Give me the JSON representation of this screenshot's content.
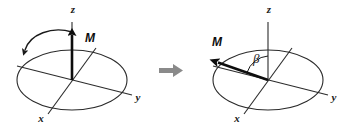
{
  "figure": {
    "width": 348,
    "height": 129,
    "background": "#ffffff",
    "stroke_color": "#2b2b2b",
    "vector_color": "#0d0d0d",
    "transition_arrow_color": "#8a8a8a"
  },
  "panels": [
    {
      "id": "equilibrium",
      "name": "left-panel",
      "origin": {
        "x": 72,
        "y": 80
      },
      "ellipse": {
        "cx": 72,
        "cy": 80,
        "rx": 55,
        "ry": 30
      },
      "axes": [
        {
          "name": "z",
          "label": "z",
          "label_x": 73,
          "label_y": 13,
          "x1": 72,
          "y1": 80,
          "x2": 72,
          "y2": 22,
          "arrowhead": false
        },
        {
          "name": "y",
          "label": "y",
          "label_x": 138,
          "label_y": 101,
          "x1": 17,
          "y1": 66,
          "x2": 132,
          "y2": 95,
          "arrowhead": false
        },
        {
          "name": "x",
          "label": "x",
          "label_x": 41,
          "label_y": 122,
          "x1": 96,
          "y1": 48,
          "x2": 48,
          "y2": 114,
          "arrowhead": false
        }
      ],
      "vector": {
        "name": "magnetization-vector",
        "label": "M",
        "label_x": 85,
        "label_y": 42,
        "x1": 72,
        "y1": 80,
        "x2": 72,
        "y2": 33,
        "direction": "along +z"
      },
      "precession_arrow": {
        "name": "precession-arrow",
        "present": true,
        "sense": "counterclockwise"
      },
      "angle": null
    },
    {
      "id": "tipped",
      "name": "right-panel",
      "origin": {
        "x": 268,
        "y": 80
      },
      "ellipse": {
        "cx": 268,
        "cy": 80,
        "rx": 55,
        "ry": 30
      },
      "axes": [
        {
          "name": "z",
          "label": "z",
          "label_x": 269,
          "label_y": 13,
          "x1": 268,
          "y1": 80,
          "x2": 268,
          "y2": 22,
          "arrowhead": false
        },
        {
          "name": "y",
          "label": "y",
          "label_x": 334,
          "label_y": 101,
          "x1": 213,
          "y1": 66,
          "x2": 328,
          "y2": 95,
          "arrowhead": false
        },
        {
          "name": "x",
          "label": "x",
          "label_x": 237,
          "label_y": 122,
          "x1": 292,
          "y1": 48,
          "x2": 244,
          "y2": 114,
          "arrowhead": false
        }
      ],
      "vector": {
        "name": "magnetization-vector",
        "label": "M",
        "label_x": 218,
        "label_y": 46,
        "x1": 268,
        "y1": 80,
        "x2": 214,
        "y2": 61,
        "direction": "tipped toward -y, near transverse plane"
      },
      "precession_arrow": {
        "name": "precession-arrow",
        "present": false,
        "sense": ""
      },
      "angle": {
        "name": "flip-angle",
        "label": "β",
        "label_x": 256,
        "label_y": 62,
        "between": [
          "z-axis",
          "magnetization-vector"
        ]
      }
    }
  ],
  "transition": {
    "name": "transition-arrow",
    "label": "",
    "x": 159,
    "y": 64,
    "width": 24,
    "height": 13,
    "direction": "right"
  }
}
